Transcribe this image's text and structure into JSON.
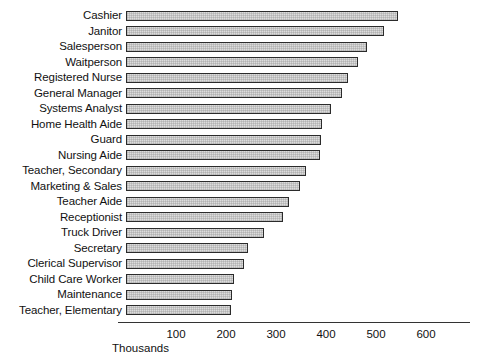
{
  "chart_data": {
    "type": "bar",
    "orientation": "horizontal",
    "title": "",
    "xlabel": "Thousands",
    "ylabel": "",
    "xlim": [
      0,
      700
    ],
    "x_ticks": [
      100,
      200,
      300,
      400,
      500,
      600
    ],
    "x_tick_labels": [
      "100",
      "200",
      "300",
      "400",
      "500",
      "600"
    ],
    "grid": false,
    "legend": null,
    "units": "thousands",
    "categories": [
      "Cashier",
      "Janitor",
      "Salesperson",
      "Waitperson",
      "Registered Nurse",
      "General Manager",
      "Systems Analyst",
      "Home Health Aide",
      "Guard",
      "Nursing Aide",
      "Teacher, Secondary",
      "Marketing & Sales",
      "Teacher Aide",
      "Receptionist",
      "Truck Driver",
      "Secretary",
      "Clerical Supervisor",
      "Child Care Worker",
      "Maintenance",
      "Teacher, Elementary"
    ],
    "values": [
      544,
      516,
      482,
      464,
      444,
      432,
      410,
      392,
      390,
      388,
      360,
      348,
      326,
      314,
      276,
      244,
      236,
      216,
      212,
      210
    ],
    "bar_fill_color": "#dcdcdc",
    "bar_edge_color": "#2b2b2b",
    "axis_color": "#333333",
    "background_color": "#ffffff"
  }
}
